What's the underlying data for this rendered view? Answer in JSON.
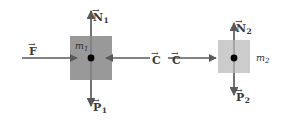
{
  "figure": {
    "background": "#ffffff",
    "stroke_color": "#5a5a5a",
    "label_color": "#3a3a3a",
    "dot_color": "#000000"
  },
  "blocks": [
    {
      "id": "block-1",
      "mass_label": "m",
      "mass_subscript": "1",
      "fill": "#999999",
      "x": 70,
      "y": 36,
      "width": 42,
      "height": 44
    },
    {
      "id": "block-2",
      "mass_label": "m",
      "mass_subscript": "2",
      "fill": "#cccccc",
      "x": 218,
      "y": 40,
      "width": 32,
      "height": 33
    }
  ],
  "vectors": [
    {
      "id": "vector-N1",
      "symbol": "N",
      "subscript": "1",
      "arrow": "→",
      "direction": "up",
      "color": "#5a5a5a",
      "label_x": 93,
      "label_y": 8
    },
    {
      "id": "vector-P1",
      "symbol": "P",
      "subscript": "1",
      "arrow": "→",
      "direction": "down",
      "color": "#5a5a5a",
      "label_x": 93,
      "label_y": 98
    },
    {
      "id": "vector-F",
      "symbol": "F",
      "subscript": "",
      "arrow": "→",
      "direction": "right",
      "color": "#5a5a5a",
      "label_x": 29,
      "label_y": 42
    },
    {
      "id": "vector-C1",
      "symbol": "C",
      "subscript": "",
      "arrow": "→",
      "direction": "left",
      "color": "#5a5a5a",
      "label_x": 152,
      "label_y": 51
    },
    {
      "id": "vector-C2",
      "symbol": "C",
      "subscript": "",
      "arrow": "→",
      "direction": "right",
      "color": "#5a5a5a",
      "label_x": 172,
      "label_y": 51
    },
    {
      "id": "vector-N2",
      "symbol": "N",
      "subscript": "2",
      "arrow": "→",
      "direction": "up",
      "color": "#5a5a5a",
      "label_x": 236,
      "label_y": 19
    },
    {
      "id": "vector-P2",
      "symbol": "P",
      "subscript": "2",
      "arrow": "→",
      "direction": "down",
      "color": "#5a5a5a",
      "label_x": 236,
      "label_y": 88
    }
  ],
  "mass_labels": [
    {
      "id": "mass-label-1",
      "text": "m",
      "sub": "1",
      "x": 75,
      "y": 41
    },
    {
      "id": "mass-label-2",
      "text": "m",
      "sub": "2",
      "x": 256,
      "y": 53
    }
  ]
}
